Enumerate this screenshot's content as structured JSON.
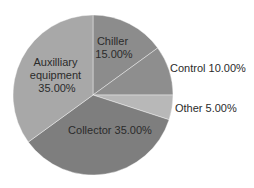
{
  "chart_data": {
    "type": "pie",
    "title": "",
    "start": "top",
    "direction": "clockwise",
    "slices": [
      {
        "name": "Chiller",
        "value": 15.0,
        "label_lines": [
          "Chiller",
          "15.00%"
        ],
        "color": "#8c8c8c",
        "label_position": "inside"
      },
      {
        "name": "Control",
        "value": 10.0,
        "label_lines": [
          "Control 10.00%"
        ],
        "color": "#8e8e8e",
        "label_position": "outside"
      },
      {
        "name": "Other",
        "value": 5.0,
        "label_lines": [
          "Other 5.00%"
        ],
        "color": "#b8b8b8",
        "label_position": "outside"
      },
      {
        "name": "Collector",
        "value": 35.0,
        "label_lines": [
          "Collector 35.00%"
        ],
        "color": "#7e7e7e",
        "label_position": "inside"
      },
      {
        "name": "Auxilliary equipment",
        "value": 35.0,
        "label_lines": [
          "Auxilliary",
          "equipment",
          "35.00%"
        ],
        "color": "#a8a8a8",
        "label_position": "inside"
      }
    ],
    "legend": "none"
  }
}
